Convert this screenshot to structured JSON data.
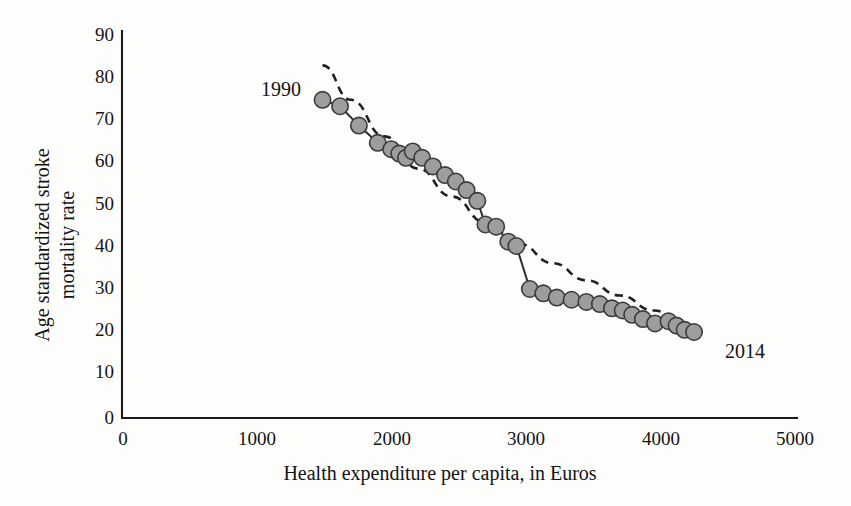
{
  "chart_data": {
    "type": "scatter",
    "title": "",
    "subtitle": "",
    "xlabel": "Health expenditure per capita, in Euros",
    "ylabel": "Age standardized stroke mortality rate",
    "ylabel_line1": "Age standardized stroke",
    "ylabel_line2": "mortality rate",
    "xlim": [
      0,
      5000
    ],
    "ylim": [
      0,
      90
    ],
    "xticks": [
      0,
      1000,
      2000,
      3000,
      4000,
      5000
    ],
    "yticks": [
      0,
      10,
      20,
      30,
      40,
      50,
      60,
      70,
      80,
      90
    ],
    "xtick_labels": [
      "0",
      "1000",
      "2000",
      "3000",
      "4000",
      "5000"
    ],
    "ytick_labels": [
      "0",
      "10",
      "20",
      "30",
      "40",
      "50",
      "60",
      "70",
      "80",
      "90"
    ],
    "grid": false,
    "legend": "none",
    "annotations": [
      {
        "text": "1990",
        "x": 1330,
        "y": 75,
        "anchor": "end"
      },
      {
        "text": "2014",
        "x": 4480,
        "y": 14,
        "anchor": "start"
      }
    ],
    "series": [
      {
        "name": "Stroke mortality vs health expenditure, 1990-2014",
        "marker": "circle",
        "marker_color": "#9d9d9d",
        "marker_edge_color": "#3a3a3a",
        "line_color": "#2b2b2b",
        "x": [
          1490,
          1620,
          1760,
          1900,
          2000,
          2060,
          2110,
          2160,
          2230,
          2310,
          2400,
          2480,
          2560,
          2640,
          2700,
          2780,
          2870,
          2930,
          3030,
          3130,
          3230,
          3340,
          3450,
          3550,
          3640,
          3720,
          3790,
          3870,
          3960,
          4060,
          4120,
          4180,
          4250
        ],
        "y": [
          74.0,
          72.5,
          68.0,
          64.0,
          62.5,
          61.5,
          60.5,
          62.0,
          60.5,
          58.5,
          56.5,
          55.0,
          53.0,
          50.5,
          45.0,
          44.5,
          41.0,
          40.0,
          30.0,
          29.0,
          28.0,
          27.5,
          27.0,
          26.5,
          25.5,
          25.0,
          24.0,
          23.0,
          22.0,
          22.5,
          21.5,
          20.5,
          20.0
        ]
      }
    ],
    "trend": {
      "name": "fitted trend (dashed)",
      "style": "dashed",
      "color": "#1f1f1f",
      "x": [
        1490,
        1700,
        1950,
        2200,
        2450,
        2700,
        2950,
        3200,
        3450,
        3700,
        3950,
        4180
      ],
      "y": [
        82.0,
        74.0,
        65.5,
        58.0,
        51.5,
        45.5,
        40.5,
        36.0,
        32.0,
        28.5,
        25.0,
        22.0
      ]
    }
  }
}
